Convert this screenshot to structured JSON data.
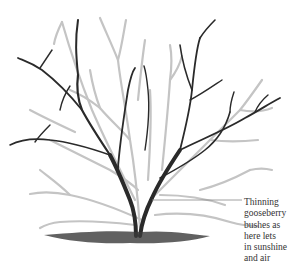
{
  "illustration": {
    "subject": "pruned gooseberry bush",
    "colors": {
      "kept_branches": "#2a2a2a",
      "removed_branches": "#bdbdbd",
      "ground": "#3a3a3a",
      "callout_line": "#888888"
    }
  },
  "caption": {
    "lines": [
      "Thinning",
      "gooseberry",
      "bushes as",
      "here lets",
      "in sunshine",
      "and air"
    ]
  }
}
